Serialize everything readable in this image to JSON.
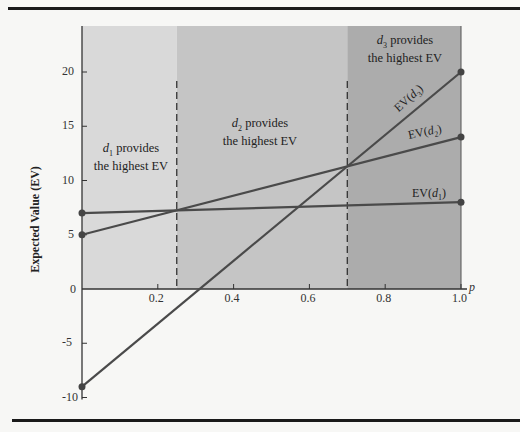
{
  "chart_data": {
    "type": "line",
    "title": "",
    "xlabel": "p",
    "ylabel": "Expected Value (EV)",
    "xlim": [
      0,
      1.0
    ],
    "ylim": [
      -10,
      24
    ],
    "x_ticks": [
      0.2,
      0.4,
      0.6,
      0.8,
      1.0
    ],
    "x_tick_labels": [
      "0.2",
      "0.4",
      "0.6",
      "0.8",
      "1.0"
    ],
    "y_ticks": [
      -10,
      -5,
      0,
      5,
      10,
      15,
      20
    ],
    "y_tick_labels": [
      "-10",
      "-5",
      "0",
      "5",
      "10",
      "15",
      "20"
    ],
    "series": [
      {
        "name": "EV(d1)",
        "x": [
          0,
          1
        ],
        "values": [
          7,
          8
        ]
      },
      {
        "name": "EV(d2)",
        "x": [
          0,
          1
        ],
        "values": [
          5,
          14
        ]
      },
      {
        "name": "EV(d3)",
        "x": [
          0,
          1
        ],
        "values": [
          -9,
          20
        ]
      }
    ],
    "regions": [
      {
        "from": 0,
        "to": 0.25,
        "label_sub": "1",
        "label": "provides the highest EV",
        "color": "#d9d9d9"
      },
      {
        "from": 0.25,
        "to": 0.7,
        "label_sub": "2",
        "label": "provides the highest EV",
        "color": "#c5c5c5"
      },
      {
        "from": 0.7,
        "to": 1.0,
        "label_sub": "3",
        "label": "provides the highest EV",
        "color": "#acacac"
      }
    ],
    "boundaries": [
      0.25,
      0.7
    ],
    "grid": false,
    "legend": "inline labels"
  },
  "labels": {
    "region1_line1": "provides",
    "region1_line2": "the highest EV",
    "region2_line1": "provides",
    "region2_line2": "the highest EV",
    "region3_line1": "provides",
    "region3_line2": "the highest EV",
    "d": "d",
    "sub1": "1",
    "sub2": "2",
    "sub3": "3",
    "ev": "EV(",
    "close": ")",
    "xaxis": "p",
    "yaxis": "Expected Value (EV)"
  }
}
